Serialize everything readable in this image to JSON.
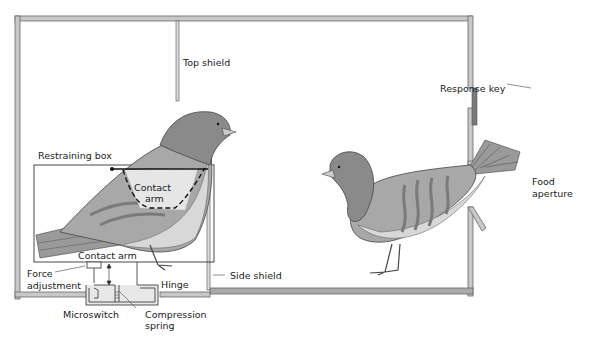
{
  "diagram": {
    "labels": {
      "top_shield": "Top shield",
      "restraining_box": "Restraining box",
      "contact_arm_inner_1": "Contact",
      "contact_arm_inner_2": "arm",
      "contact_arm": "Contact arm",
      "force_adjustment_1": "Force",
      "force_adjustment_2": "adjustment",
      "hinge": "Hinge",
      "side_shield": "Side shield",
      "microswitch": "Microswitch",
      "compression_spring_1": "Compression",
      "compression_spring_2": "spring",
      "response_key": "Response key",
      "food_aperture_1": "Food",
      "food_aperture_2": "aperture"
    },
    "colors": {
      "wall": "#b8b8b8",
      "wall_outline": "#666666",
      "bird_head": "#8a8a8a",
      "bird_wing": "#a8a8a8",
      "bird_belly": "#d8d8d8",
      "bird_stripes": "#7a7a7a",
      "response_key": "#7a7a7a"
    }
  }
}
